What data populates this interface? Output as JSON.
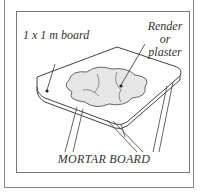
{
  "figure": {
    "top_text_partial": "... you can make a mortar board ...",
    "labels": {
      "board": "1 x 1 m board",
      "material_line1": "Render or",
      "material_line2": "plaster"
    },
    "caption": "MORTAR BOARD"
  }
}
